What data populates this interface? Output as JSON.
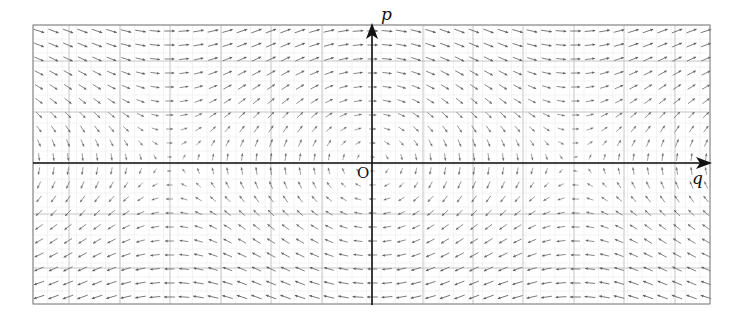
{
  "diagram": {
    "type": "vector-field",
    "system": {
      "q_dot": "p",
      "p_dot": "-sin(q)"
    },
    "axes": {
      "x_label": "q",
      "y_label": "p",
      "origin_label": "O"
    },
    "frame": {
      "left": 33,
      "top": 25,
      "right": 710,
      "bottom": 304
    },
    "origin_px": {
      "x": 372,
      "y": 163
    },
    "scale": {
      "px_per_q": 64.3,
      "px_per_p": 50.0
    },
    "grid": {
      "major_x": [
        33,
        69,
        120,
        170,
        221,
        271,
        322,
        372,
        423,
        473,
        523,
        574,
        624,
        675,
        710
      ],
      "major_y": [
        25,
        61,
        112,
        163,
        214,
        268,
        304
      ],
      "color": "#b8b8b8",
      "minor_color": "#e6e6e6"
    },
    "arrows": {
      "dx": 14.5,
      "dy": 14.0,
      "color": "#555555",
      "max_len": 11
    },
    "colors": {
      "axis": "#111111",
      "frame": "#8a8a8a"
    }
  }
}
